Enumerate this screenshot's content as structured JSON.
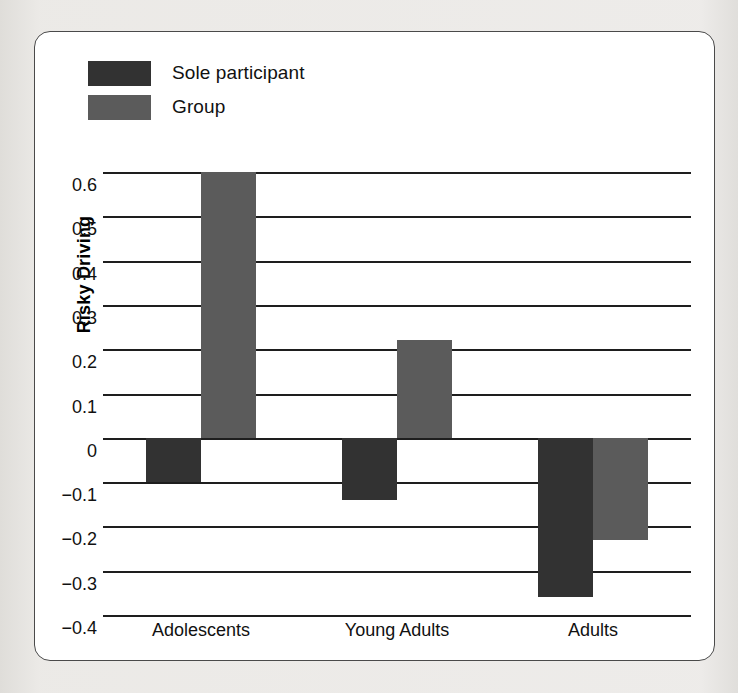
{
  "chart_data": {
    "type": "bar",
    "title": "",
    "xlabel": "",
    "ylabel": "Risky Driving",
    "categories": [
      "Adolescents",
      "Young Adults",
      "Adults"
    ],
    "series": [
      {
        "name": "Sole participant",
        "color": "#323232",
        "values": [
          -0.1,
          -0.14,
          -0.36
        ]
      },
      {
        "name": "Group",
        "color": "#5b5b5b",
        "values": [
          0.6,
          0.22,
          -0.23
        ]
      }
    ],
    "ylim": [
      -0.4,
      0.6
    ],
    "ytick_values": [
      0.6,
      0.5,
      0.4,
      0.3,
      0.2,
      0.1,
      0,
      -0.1,
      -0.2,
      -0.3,
      -0.4
    ],
    "ytick_labels": [
      "0.6",
      "0.5",
      "0.4",
      "0.3",
      "0.2",
      "0.1",
      "0",
      "−0.1",
      "−0.2",
      "−0.3",
      "−0.4"
    ],
    "grid": true,
    "legend_position": "top-left",
    "zero_line": 0
  },
  "legend": {
    "items": [
      {
        "label": "Sole participant",
        "color": "#323232"
      },
      {
        "label": "Group",
        "color": "#5b5b5b"
      }
    ]
  },
  "axis": {
    "y_title": "Risky Driving"
  }
}
